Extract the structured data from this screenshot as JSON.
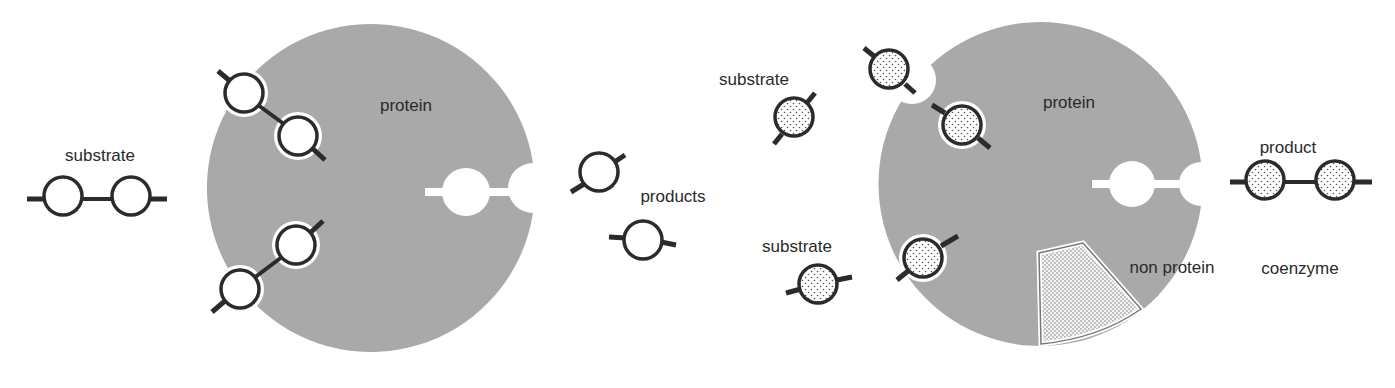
{
  "figure": {
    "left_panel": {
      "title": "Enzyme (protein only) cleaving a substrate",
      "labels": {
        "substrate": "substrate",
        "protein": "protein",
        "products": "products"
      }
    },
    "right_panel": {
      "title": "Enzyme with non-protein coenzyme joining substrates",
      "labels": {
        "substrate_top": "substrate",
        "substrate_bottom": "substrate",
        "protein": "protein",
        "product": "product",
        "non_protein": "non protein",
        "coenzyme": "coenzyme"
      }
    },
    "colors": {
      "protein_fill": "#a9a9a9",
      "outline": "#2b2b2b",
      "background": "#ffffff",
      "text": "#2a2a2a"
    }
  }
}
